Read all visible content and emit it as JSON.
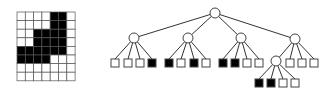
{
  "figure": {
    "width": 334,
    "height": 93,
    "colors": {
      "fill": "#000000",
      "empty": "#ffffff",
      "stroke": "#444444",
      "line": "#333333"
    }
  },
  "image_grid": {
    "x": 17,
    "y": 12,
    "cols": 7,
    "rows": 8,
    "cell_w": 8.3,
    "cell_h": 8.6,
    "cells": [
      [
        0,
        0,
        0,
        0,
        1,
        1,
        0
      ],
      [
        0,
        0,
        0,
        0,
        1,
        1,
        0
      ],
      [
        0,
        0,
        1,
        1,
        1,
        1,
        0
      ],
      [
        0,
        0,
        1,
        1,
        1,
        1,
        0
      ],
      [
        1,
        1,
        1,
        1,
        1,
        1,
        0
      ],
      [
        1,
        1,
        1,
        1,
        0,
        0,
        0
      ],
      [
        0,
        0,
        0,
        0,
        0,
        0,
        0
      ],
      [
        0,
        0,
        0,
        0,
        0,
        0,
        0
      ]
    ]
  },
  "quadtree": {
    "node_radius": 5,
    "leaf_size": 8,
    "nodes": [
      {
        "id": "root",
        "x": 215,
        "y": 13
      },
      {
        "id": "nw",
        "x": 134,
        "y": 38,
        "parent": "root"
      },
      {
        "id": "ne",
        "x": 188,
        "y": 38,
        "parent": "root"
      },
      {
        "id": "sw",
        "x": 241,
        "y": 38,
        "parent": "root"
      },
      {
        "id": "se",
        "x": 295,
        "y": 39,
        "parent": "root"
      },
      {
        "id": "se_nw",
        "x": 276,
        "y": 61,
        "parent": "se"
      }
    ],
    "leaves": [
      {
        "x": 111,
        "y": 59,
        "filled": false,
        "parent": "nw"
      },
      {
        "x": 124,
        "y": 59,
        "filled": false,
        "parent": "nw"
      },
      {
        "x": 136,
        "y": 59,
        "filled": false,
        "parent": "nw"
      },
      {
        "x": 148,
        "y": 59,
        "filled": true,
        "parent": "nw"
      },
      {
        "x": 165,
        "y": 59,
        "filled": true,
        "parent": "ne"
      },
      {
        "x": 177,
        "y": 59,
        "filled": false,
        "parent": "ne"
      },
      {
        "x": 190,
        "y": 59,
        "filled": true,
        "parent": "ne"
      },
      {
        "x": 202,
        "y": 59,
        "filled": false,
        "parent": "ne"
      },
      {
        "x": 219,
        "y": 59,
        "filled": true,
        "parent": "sw"
      },
      {
        "x": 231,
        "y": 59,
        "filled": true,
        "parent": "sw"
      },
      {
        "x": 243,
        "y": 59,
        "filled": false,
        "parent": "sw"
      },
      {
        "x": 255,
        "y": 59,
        "filled": false,
        "parent": "sw"
      },
      {
        "x": 286,
        "y": 59,
        "filled": false,
        "parent": "se"
      },
      {
        "x": 298,
        "y": 59,
        "filled": false,
        "parent": "se"
      },
      {
        "x": 310,
        "y": 59,
        "filled": false,
        "parent": "se"
      },
      {
        "x": 255,
        "y": 79,
        "filled": true,
        "parent": "se_nw"
      },
      {
        "x": 267,
        "y": 79,
        "filled": true,
        "parent": "se_nw"
      },
      {
        "x": 279,
        "y": 79,
        "filled": false,
        "parent": "se_nw"
      },
      {
        "x": 291,
        "y": 79,
        "filled": false,
        "parent": "se_nw"
      }
    ]
  }
}
